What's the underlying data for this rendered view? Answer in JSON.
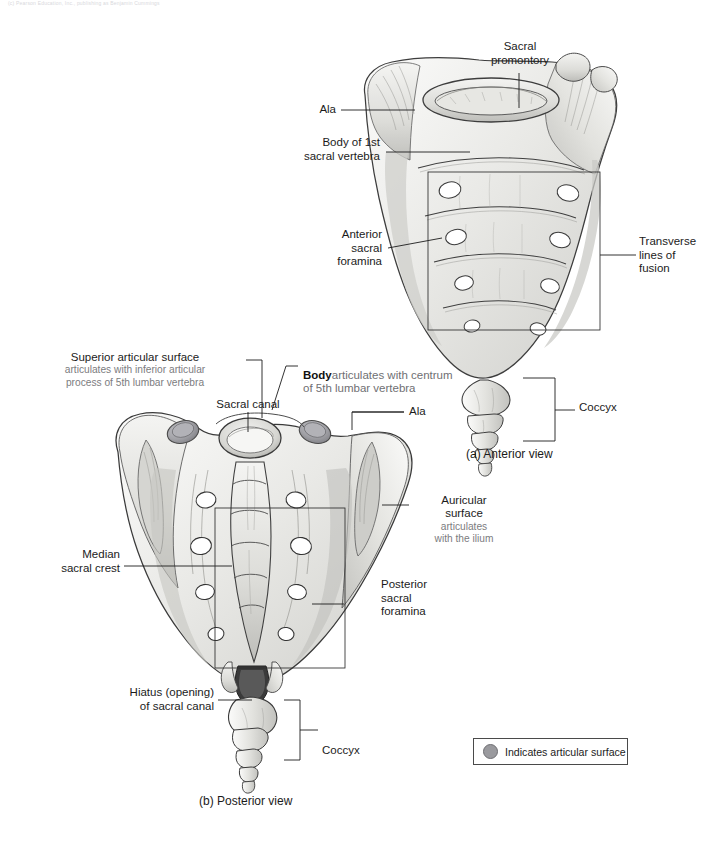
{
  "page": {
    "header_note": "(c) Pearson Education, Inc., publishing as Benjamin Cummings"
  },
  "figures": [
    {
      "id": "anterior",
      "caption": "(a) Anterior view",
      "labels": [
        {
          "name": "sacral-promontory",
          "text": "Sacral\npromontory"
        },
        {
          "name": "ala-anterior",
          "text": "Ala"
        },
        {
          "name": "body-of-1st-sacral-vertebra",
          "text": "Body of 1st\nsacral vertebra"
        },
        {
          "name": "anterior-sacral-foramina",
          "text": "Anterior\nsacral\nforamina"
        },
        {
          "name": "transverse-lines-of-fusion",
          "text": "Transverse\nlines of\nfusion"
        },
        {
          "name": "coccyx-anterior",
          "text": "Coccyx"
        }
      ]
    },
    {
      "id": "posterior",
      "caption": "(b) Posterior view",
      "labels": [
        {
          "name": "superior-articular-surface",
          "title": "Superior articular surface",
          "detail": "articulates with inferior articular\nprocess of 5th lumbar vertebra"
        },
        {
          "name": "body-articular",
          "title": "Body",
          "detail": "articulates with centrum\nof 5th lumbar vertebra"
        },
        {
          "name": "sacral-canal",
          "text": "Sacral canal"
        },
        {
          "name": "ala-posterior",
          "text": "Ala"
        },
        {
          "name": "auricular-surface",
          "title": "Auricular\nsurface",
          "detail": "articulates\nwith the ilium"
        },
        {
          "name": "median-sacral-crest",
          "text": "Median\nsacral crest"
        },
        {
          "name": "posterior-sacral-foramina",
          "text": "Posterior\nsacral\nforamina"
        },
        {
          "name": "hiatus-of-sacral-canal",
          "text": "Hiatus (opening)\nof sacral canal"
        },
        {
          "name": "coccyx-posterior",
          "text": "Coccyx"
        }
      ]
    }
  ],
  "legend": {
    "swatch_color": "#9a9a9e",
    "text": "Indicates articular surface"
  }
}
